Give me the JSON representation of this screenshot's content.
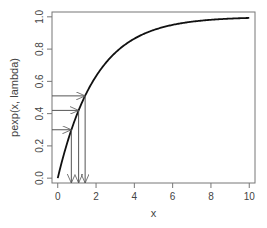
{
  "chart_data": {
    "type": "line",
    "title": "",
    "xlabel": "x",
    "ylabel": "pexp(x, lambda)",
    "xlim": [
      -0.3,
      10.3
    ],
    "ylim": [
      -0.03,
      1.03
    ],
    "xticks": [
      0,
      2,
      4,
      6,
      8,
      10
    ],
    "yticks": [
      0.0,
      0.2,
      0.4,
      0.6,
      0.8,
      1.0
    ],
    "ytick_labels": [
      "0.0",
      "0.2",
      "0.4",
      "0.6",
      "0.8",
      "1.0"
    ],
    "grid": false,
    "legend": null,
    "series": [
      {
        "name": "pexp(x, 0.5)",
        "function": "1 - exp(-0.5 x)",
        "lambda": 0.5,
        "x": [
          0,
          0.5,
          1,
          1.5,
          2,
          3,
          4,
          5,
          6,
          7,
          8,
          9,
          10
        ],
        "values": [
          0,
          0.221,
          0.393,
          0.528,
          0.632,
          0.777,
          0.865,
          0.918,
          0.95,
          0.97,
          0.982,
          0.989,
          0.993
        ]
      }
    ],
    "annotations": {
      "description": "Inverse-CDF arrows: horizontal arrows from y-axis at probability p to the curve, then vertical arrows down to x-axis at quantile",
      "probabilities": [
        0.3,
        0.42,
        0.51
      ],
      "quantiles": [
        0.71,
        1.09,
        1.43
      ]
    }
  }
}
